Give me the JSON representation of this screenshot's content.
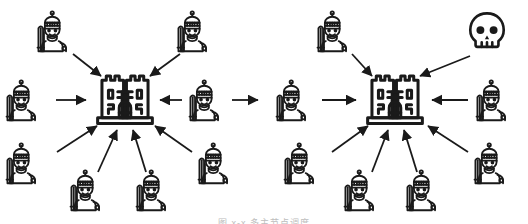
{
  "figure": {
    "title": "",
    "caption": "图 x-x  多主节点调度",
    "caption_y": 216,
    "background": "#ffffff",
    "stroke_color": "#1a1a1a",
    "canvas": {
      "width": 528,
      "height": 224
    }
  },
  "chart_data": {
    "type": "diagram",
    "title": "",
    "legend": [
      {
        "key": "castle",
        "label": "castle"
      },
      {
        "key": "knight",
        "label": "knight"
      },
      {
        "key": "skull",
        "label": "skull"
      }
    ],
    "nodes": [
      {
        "id": "castle-left",
        "icon": "castle",
        "x": 125,
        "y": 99,
        "size": 72,
        "cluster": "left"
      },
      {
        "id": "castle-right",
        "icon": "castle",
        "x": 395,
        "y": 99,
        "size": 72,
        "cluster": "right"
      },
      {
        "id": "knight-l-top",
        "icon": "knight",
        "x": 55,
        "y": 31,
        "size": 46,
        "cluster": "left"
      },
      {
        "id": "knight-l-topright",
        "icon": "knight",
        "x": 195,
        "y": 31,
        "size": 46,
        "cluster": "left"
      },
      {
        "id": "knight-l-left",
        "icon": "knight",
        "x": 24,
        "y": 100,
        "size": 46,
        "cluster": "left"
      },
      {
        "id": "knight-l-right",
        "icon": "knight",
        "x": 207,
        "y": 100,
        "size": 46,
        "cluster": "left"
      },
      {
        "id": "knight-l-lowleft",
        "icon": "knight",
        "x": 24,
        "y": 163,
        "size": 46,
        "cluster": "left"
      },
      {
        "id": "knight-l-bot1",
        "icon": "knight",
        "x": 88,
        "y": 190,
        "size": 46,
        "cluster": "left"
      },
      {
        "id": "knight-l-bot2",
        "icon": "knight",
        "x": 154,
        "y": 190,
        "size": 46,
        "cluster": "left"
      },
      {
        "id": "knight-l-lowright",
        "icon": "knight",
        "x": 216,
        "y": 163,
        "size": 46,
        "cluster": "left"
      },
      {
        "id": "knight-r-top",
        "icon": "knight",
        "x": 335,
        "y": 31,
        "size": 46,
        "cluster": "right"
      },
      {
        "id": "skull-r-topright",
        "icon": "skull",
        "x": 487,
        "y": 31,
        "size": 44,
        "cluster": "right"
      },
      {
        "id": "knight-r-left",
        "icon": "knight",
        "x": 294,
        "y": 100,
        "size": 46,
        "cluster": "right"
      },
      {
        "id": "knight-r-right",
        "icon": "knight",
        "x": 494,
        "y": 100,
        "size": 46,
        "cluster": "right"
      },
      {
        "id": "knight-r-lowleft",
        "icon": "knight",
        "x": 302,
        "y": 163,
        "size": 46,
        "cluster": "right"
      },
      {
        "id": "knight-r-bot1",
        "icon": "knight",
        "x": 362,
        "y": 190,
        "size": 46,
        "cluster": "right"
      },
      {
        "id": "knight-r-bot2",
        "icon": "knight",
        "x": 424,
        "y": 190,
        "size": 46,
        "cluster": "right"
      },
      {
        "id": "knight-r-lowright",
        "icon": "knight",
        "x": 492,
        "y": 163,
        "size": 46,
        "cluster": "right"
      }
    ],
    "edges": [
      {
        "from": "knight-l-top",
        "to": "castle-left",
        "x1": 73,
        "y1": 54,
        "x2": 101,
        "y2": 76
      },
      {
        "from": "knight-l-topright",
        "to": "castle-left",
        "x1": 180,
        "y1": 54,
        "x2": 150,
        "y2": 76
      },
      {
        "from": "knight-l-left",
        "to": "castle-left",
        "x1": 56,
        "y1": 100,
        "x2": 86,
        "y2": 100
      },
      {
        "from": "knight-l-right",
        "to": "castle-left",
        "x1": 182,
        "y1": 100,
        "x2": 160,
        "y2": 100
      },
      {
        "from": "knight-l-lowleft",
        "to": "castle-left",
        "x1": 57,
        "y1": 152,
        "x2": 97,
        "y2": 126
      },
      {
        "from": "knight-l-bot1",
        "to": "castle-left",
        "x1": 98,
        "y1": 172,
        "x2": 117,
        "y2": 130
      },
      {
        "from": "knight-l-bot2",
        "to": "castle-left",
        "x1": 146,
        "y1": 172,
        "x2": 133,
        "y2": 130
      },
      {
        "from": "knight-l-lowright",
        "to": "castle-left",
        "x1": 192,
        "y1": 152,
        "x2": 155,
        "y2": 126
      },
      {
        "from": "knight-l-right",
        "to": "castle-right",
        "x1": 232,
        "y1": 100,
        "x2": 258,
        "y2": 100
      },
      {
        "from": "knight-r-left",
        "to": "castle-right",
        "x1": 322,
        "y1": 100,
        "x2": 356,
        "y2": 100
      },
      {
        "from": "knight-r-top",
        "to": "castle-right",
        "x1": 352,
        "y1": 54,
        "x2": 372,
        "y2": 76
      },
      {
        "from": "skull-r-topright",
        "to": "castle-right",
        "x1": 470,
        "y1": 56,
        "x2": 420,
        "y2": 76
      },
      {
        "from": "knight-r-right",
        "to": "castle-right",
        "x1": 468,
        "y1": 100,
        "x2": 432,
        "y2": 100
      },
      {
        "from": "knight-r-lowleft",
        "to": "castle-right",
        "x1": 332,
        "y1": 152,
        "x2": 368,
        "y2": 126
      },
      {
        "from": "knight-r-bot1",
        "to": "castle-right",
        "x1": 372,
        "y1": 172,
        "x2": 388,
        "y2": 130
      },
      {
        "from": "knight-r-bot2",
        "to": "castle-right",
        "x1": 417,
        "y1": 172,
        "x2": 404,
        "y2": 130
      },
      {
        "from": "knight-r-lowright",
        "to": "castle-right",
        "x1": 468,
        "y1": 152,
        "x2": 428,
        "y2": 126
      }
    ]
  }
}
